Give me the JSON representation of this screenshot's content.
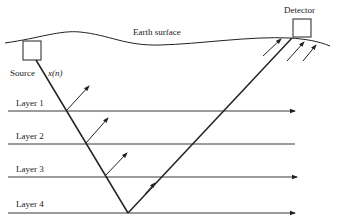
{
  "diagram": {
    "labels": {
      "earth_surface": "Earth surface",
      "detector": "Detector",
      "source": "Source",
      "signal": "x(n)"
    },
    "layers": [
      {
        "label": "Layer 1",
        "y": 111,
        "arrow": true
      },
      {
        "label": "Layer 2",
        "y": 144,
        "arrow": false
      },
      {
        "label": "Layer 3",
        "y": 177,
        "arrow": true
      },
      {
        "label": "Layer 4",
        "y": 213,
        "arrow": true
      }
    ],
    "colors": {
      "line": "#222222",
      "background": "#ffffff"
    }
  }
}
